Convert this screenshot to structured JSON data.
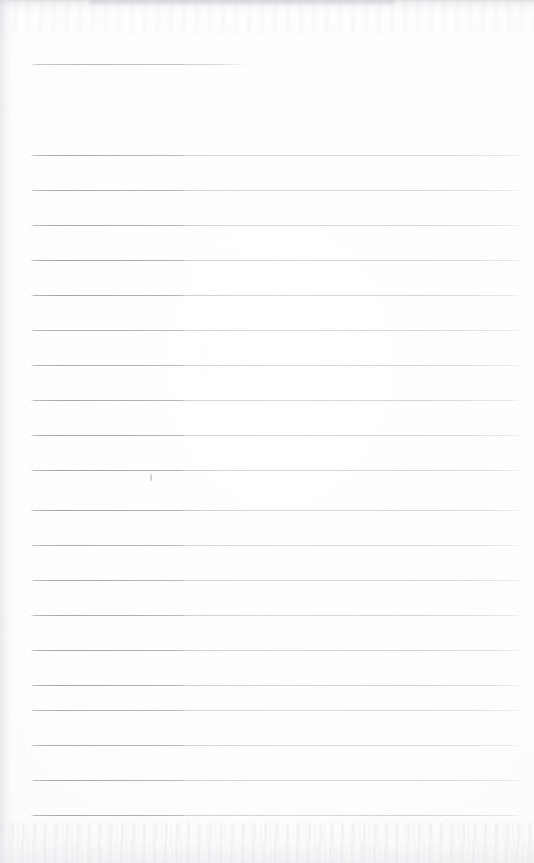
{
  "document": {
    "kind": "scanned-lined-notepad-page",
    "title": "Blank ruled notepad page (scan)",
    "page_width": 534,
    "page_height": 863,
    "paper_color": "#fdfdfd",
    "rule_color": "#9496a0",
    "rule_color_light": "#b2b4bd",
    "written_content": "",
    "note": "No handwriting or printed text present on the page"
  },
  "rules": {
    "left_x": 30,
    "right_x": 522,
    "segment_break_x": 183,
    "thickness": 1,
    "spacing": 35,
    "header_rule": {
      "y": 64,
      "left_x": 30,
      "right_x": 248
    },
    "body_y_positions": [
      155,
      190,
      225,
      260,
      295,
      330,
      365,
      400,
      435,
      470,
      510,
      545,
      580,
      615,
      650,
      685,
      710,
      745,
      780,
      815
    ]
  },
  "marks": [
    {
      "name": "pencil-tick",
      "x": 150,
      "y": 472,
      "width": 2,
      "height": 9
    }
  ],
  "scan_artifacts": {
    "top_edge_shadow": true,
    "left_edge_shadow": true,
    "bottom_edge_mottling": true
  }
}
